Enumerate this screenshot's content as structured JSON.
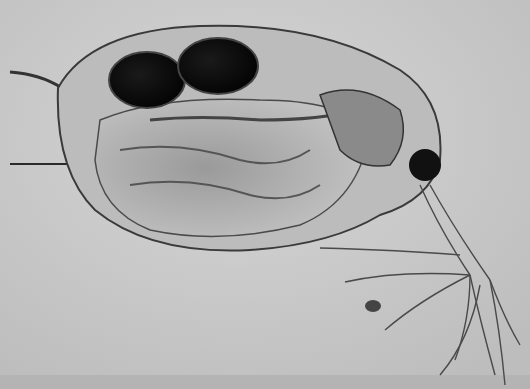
{
  "image": {
    "subject": "Daphnia (water flea) micrograph",
    "width": 530,
    "height": 389,
    "colors": {
      "background": "#c8c8c8",
      "background_light": "#d4d4d4",
      "carapace": "#b9b9b9",
      "outline": "#3a3a3a",
      "eggs": "#0e0e0e",
      "gut": "#6a6a6a",
      "eye": "#111111",
      "pointer_line": "#2a2a2a"
    },
    "features": [
      "carapace",
      "tail-spine",
      "brood-eggs",
      "gut",
      "compound-eye",
      "antennae",
      "pointer-line",
      "debris-speck"
    ]
  }
}
